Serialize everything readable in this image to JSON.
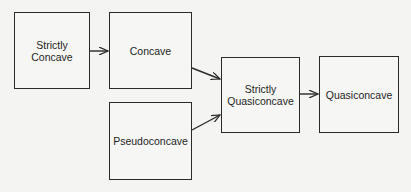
{
  "diagram": {
    "nodes": [
      {
        "id": "strictly_concave",
        "label": "Strictly\nConcave"
      },
      {
        "id": "concave",
        "label": "Concave"
      },
      {
        "id": "pseudoconcave",
        "label": "Pseudoconcave"
      },
      {
        "id": "strictly_quasiconcave",
        "label": "Strictly\nQuasiconcave"
      },
      {
        "id": "quasiconcave",
        "label": "Quasiconcave"
      }
    ],
    "edges": [
      {
        "from": "strictly_concave",
        "to": "concave"
      },
      {
        "from": "concave",
        "to": "strictly_quasiconcave"
      },
      {
        "from": "pseudoconcave",
        "to": "strictly_quasiconcave"
      },
      {
        "from": "strictly_quasiconcave",
        "to": "quasiconcave"
      }
    ],
    "colors": {
      "stroke": "#2a2a2a",
      "background": "#f4f4f2",
      "text": "#1e1e1e"
    }
  }
}
